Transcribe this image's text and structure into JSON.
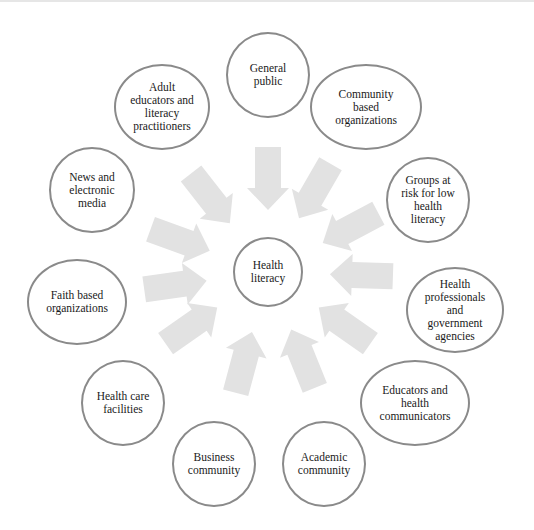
{
  "diagram": {
    "title": "",
    "arrow_color": "#e2e2e2",
    "node_border_color": "#8a8a8a",
    "center": {
      "label": "Health\nliteracy",
      "cx": 268,
      "cy": 272,
      "rx": 35,
      "ry": 35
    },
    "nodes": [
      {
        "id": "general-public",
        "label": "General\npublic",
        "cx": 268,
        "cy": 75,
        "rx": 42,
        "ry": 43,
        "angle": -90
      },
      {
        "id": "community-based-organizations",
        "label": "Community\nbased\norganizations",
        "cx": 366,
        "cy": 107,
        "rx": 56,
        "ry": 43,
        "angle": -60
      },
      {
        "id": "groups-at-risk",
        "label": "Groups at\nrisk for low\nhealth\nliteracy",
        "cx": 428,
        "cy": 200,
        "rx": 42,
        "ry": 43,
        "angle": -30
      },
      {
        "id": "health-professionals",
        "label": "Health\nprofessionals\nand\ngovernment\nagencies",
        "cx": 455,
        "cy": 310,
        "rx": 49,
        "ry": 43,
        "angle": 0
      },
      {
        "id": "educators-health-communicators",
        "label": "Educators and\nhealth\ncommunicators",
        "cx": 415,
        "cy": 403,
        "rx": 55,
        "ry": 43,
        "angle": 30
      },
      {
        "id": "academic-community",
        "label": "Academic\ncommunity",
        "cx": 324,
        "cy": 464,
        "rx": 42,
        "ry": 43,
        "angle": 60
      },
      {
        "id": "business-community",
        "label": "Business\ncommunity",
        "cx": 214,
        "cy": 464,
        "rx": 42,
        "ry": 43,
        "angle": 100
      },
      {
        "id": "health-care-facilities",
        "label": "Health care\nfacilities",
        "cx": 123,
        "cy": 403,
        "rx": 42,
        "ry": 43,
        "angle": 140
      },
      {
        "id": "faith-based-organizations",
        "label": "Faith based\norganizations",
        "cx": 77,
        "cy": 302,
        "rx": 50,
        "ry": 43,
        "angle": 170
      },
      {
        "id": "news-electronic-media",
        "label": "News and\nelectronic\nmedia",
        "cx": 92,
        "cy": 190,
        "rx": 43,
        "ry": 43,
        "angle": -160
      },
      {
        "id": "adult-educators",
        "label": "Adult\neducators and\nliteracy\npractitioners",
        "cx": 162,
        "cy": 107,
        "rx": 48,
        "ry": 43,
        "angle": -125
      }
    ],
    "arrows": [
      {
        "angle": -90
      },
      {
        "angle": -60
      },
      {
        "angle": -28
      },
      {
        "angle": 2
      },
      {
        "angle": 35
      },
      {
        "angle": 68
      },
      {
        "angle": 105
      },
      {
        "angle": 145
      },
      {
        "angle": 172
      },
      {
        "angle": -160
      },
      {
        "angle": -128
      }
    ]
  }
}
